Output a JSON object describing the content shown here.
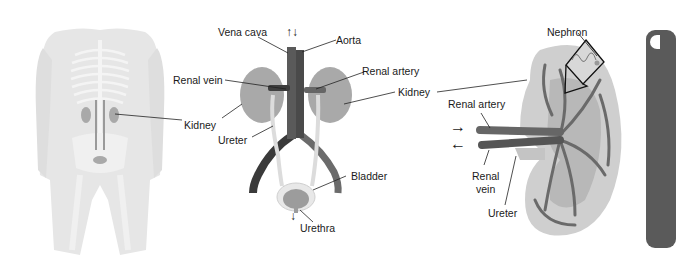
{
  "figure": {
    "panels": [
      {
        "id": "body",
        "description": "Human body silhouette with skeleton showing kidney location"
      },
      {
        "id": "urinary-system",
        "description": "Urinary system with kidneys, vessels, ureters, bladder"
      },
      {
        "id": "kidney-cross-section",
        "description": "Kidney cross-section with renal vessels and nephron inset"
      }
    ],
    "labels": {
      "body_kidney": "Kidney",
      "vena_cava": "Vena cava",
      "aorta": "Aorta",
      "renal_vein": "Renal vein",
      "renal_artery": "Renal artery",
      "kidney_right": "Kidney",
      "ureter": "Ureter",
      "bladder": "Bladder",
      "urethra": "Urethra",
      "nephron": "Nephron",
      "xs_renal_artery": "Renal artery",
      "xs_renal_vein_1": "Renal",
      "xs_renal_vein_2": "vein",
      "xs_ureter": "Ureter"
    },
    "arrows": {
      "vessel_flow": "↑↓",
      "urethra_flow": "↓",
      "artery_in": "→",
      "vein_out": "←"
    },
    "colors": {
      "body_fill": "#e4e4e4",
      "bone": "#f2f2f2",
      "kidney": "#a9a9a9",
      "vessel_dark": "#4a4a4a",
      "vessel_mid": "#6e6e6e",
      "ureter": "#dcdcdc",
      "kidney_xs_outer": "#cfcfcf",
      "kidney_xs_inner": "#b5b5b5",
      "panel": "#5a5a5a",
      "text": "#1a1a1a"
    }
  }
}
